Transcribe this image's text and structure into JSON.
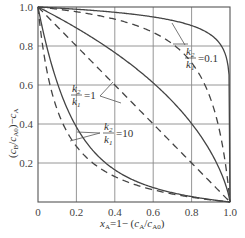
{
  "chart_data": {
    "type": "line",
    "title": "",
    "xlabel": "x_A = 1 − (c_A/c_A0)",
    "ylabel": "(c_B/c_A0) − c_A",
    "xlim": [
      0,
      1.0
    ],
    "ylim": [
      0,
      1.0
    ],
    "grid": true,
    "x_ticks": [
      "0",
      "0.2",
      "0.4",
      "0.6",
      "0.8",
      "1.0"
    ],
    "y_ticks": [
      "0.2",
      "0.4",
      "0.6",
      "0.8",
      "1.0"
    ],
    "x": [
      0,
      0.1,
      0.2,
      0.3,
      0.4,
      0.5,
      0.6,
      0.7,
      0.8,
      0.9,
      0.95,
      1.0
    ],
    "series": [
      {
        "name": "k2/k1=0.1 (solid)",
        "style": "solid",
        "values": [
          1.0,
          0.995,
          0.988,
          0.98,
          0.97,
          0.957,
          0.939,
          0.914,
          0.874,
          0.798,
          0.724,
          0.0
        ]
      },
      {
        "name": "k2/k1=0.1 (dashed)",
        "style": "dashed",
        "values": [
          1.0,
          0.989,
          0.976,
          0.959,
          0.938,
          0.909,
          0.87,
          0.811,
          0.714,
          0.526,
          0.345,
          0.0
        ]
      },
      {
        "name": "k2/k1=1 (solid)",
        "style": "solid",
        "values": [
          1.0,
          0.948,
          0.893,
          0.832,
          0.766,
          0.693,
          0.611,
          0.516,
          0.402,
          0.256,
          0.158,
          0.0
        ]
      },
      {
        "name": "k2/k1=1 (dashed)",
        "style": "dashed",
        "values": [
          1.0,
          0.9,
          0.8,
          0.7,
          0.6,
          0.5,
          0.4,
          0.3,
          0.2,
          0.1,
          0.05,
          0.0
        ]
      },
      {
        "name": "k2/k1=10 (solid)",
        "style": "solid",
        "values": [
          1.0,
          0.608,
          0.418,
          0.305,
          0.23,
          0.174,
          0.13,
          0.094,
          0.062,
          0.035,
          0.02,
          0.0
        ]
      },
      {
        "name": "k2/k1=10 (dashed)",
        "style": "dashed",
        "values": [
          1.0,
          0.474,
          0.286,
          0.189,
          0.13,
          0.091,
          0.063,
          0.041,
          0.024,
          0.011,
          0.005,
          0.0
        ]
      }
    ],
    "annotations": [
      {
        "text": "k2/k1 = 0.1",
        "x": 0.84,
        "y": 0.79
      },
      {
        "text": "k2/k1 = 1",
        "x": 0.28,
        "y": 0.56
      },
      {
        "text": "k2/k1 = 10",
        "x": 0.38,
        "y": 0.37
      }
    ]
  },
  "labels": {
    "x_axis": "x",
    "x_axis_sub": "A",
    "x_axis_rest": "=1− (c",
    "y_axis": "(c_B/c_A0)−c_A",
    "ann_k2": "k",
    "ann_k1": "k",
    "ann_01": "=0.1",
    "ann_1": "=1",
    "ann_10": "=10"
  }
}
